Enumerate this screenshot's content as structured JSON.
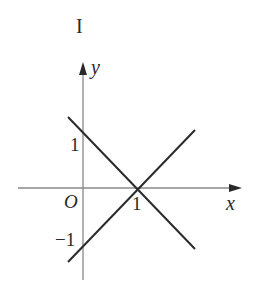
{
  "figure": {
    "label": "I",
    "x_axis_label": "x",
    "y_axis_label": "y",
    "origin_label": "O",
    "ticks": {
      "x_one": "1",
      "y_one": "1",
      "y_neg_one": "−1"
    }
  },
  "lines": [
    {
      "name": "descending-line",
      "equation": "y = -x + 1",
      "passes_through": [
        [
          0,
          1
        ],
        [
          1,
          0
        ]
      ]
    },
    {
      "name": "ascending-line",
      "equation": "y = x - 1",
      "passes_through": [
        [
          0,
          -1
        ],
        [
          1,
          0
        ]
      ]
    }
  ],
  "colors": {
    "axis": "#888888",
    "line": "#2a2a2a",
    "text": "#2a2a2a"
  }
}
